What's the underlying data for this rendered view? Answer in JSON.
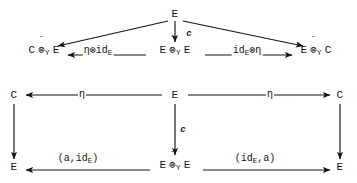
{
  "diagram": {
    "kind": "commutative-diagram",
    "symbols": {
      "tensor": "⊗",
      "hat": "ˆ",
      "eta": "η"
    },
    "nodes": [
      {
        "id": "top-e",
        "text": "E",
        "x": 175,
        "y": 14
      },
      {
        "id": "left-c-tensor-e",
        "left": "C",
        "sub": "Y",
        "right": "E",
        "hat": true,
        "x": 44,
        "y": 52
      },
      {
        "id": "mid-e-tensor-e",
        "left": "E",
        "sub": "Y",
        "right": "E",
        "hat": true,
        "x": 175,
        "y": 52
      },
      {
        "id": "right-e-tensor-c",
        "left": "E",
        "sub": "Y",
        "right": "C",
        "hat": true,
        "x": 316,
        "y": 52
      },
      {
        "id": "mid-left-c",
        "text": "C",
        "x": 14,
        "y": 95
      },
      {
        "id": "mid-center-e",
        "text": "E",
        "x": 175,
        "y": 95
      },
      {
        "id": "mid-right-c",
        "text": "C",
        "x": 340,
        "y": 95
      },
      {
        "id": "bottom-left-e",
        "text": "E",
        "x": 14,
        "y": 167
      },
      {
        "id": "bottom-mid-tensor",
        "left": "E",
        "sub": "Y",
        "right": "E",
        "hat": true,
        "x": 175,
        "y": 167
      },
      {
        "id": "bottom-right-e",
        "text": "E",
        "x": 340,
        "y": 167
      }
    ],
    "arrow_labels": [
      {
        "id": "label-c-top",
        "text": "c",
        "x": 189,
        "y": 34,
        "style": "italic"
      },
      {
        "id": "label-eta-tensor-id",
        "text": "η⊗id",
        "subscript": "E",
        "x": 98,
        "y": 52,
        "style": "plain"
      },
      {
        "id": "label-id-tensor-eta",
        "text": "id",
        "subscript": "E",
        "suffix": "⊗η",
        "x": 247,
        "y": 52,
        "style": "plain"
      },
      {
        "id": "label-eta-left",
        "text": "η",
        "x": 82,
        "y": 95,
        "style": "plain"
      },
      {
        "id": "label-eta-right",
        "text": "η",
        "x": 270,
        "y": 95,
        "style": "plain"
      },
      {
        "id": "label-c-mid",
        "text": "c",
        "x": 183,
        "y": 130,
        "style": "italic"
      },
      {
        "id": "label-a-id",
        "text": "(a,id",
        "subscript": "E",
        "suffix": ")",
        "x": 78,
        "y": 160,
        "style": "plain"
      },
      {
        "id": "label-id-a",
        "text": "(id",
        "subscript": "E",
        "suffix": ",a)",
        "x": 255,
        "y": 160,
        "style": "plain"
      }
    ],
    "arrows": [
      {
        "id": "arrow-top-e-to-left",
        "from": "top-e",
        "to": "left-c-tensor-e",
        "type": "diagonal"
      },
      {
        "id": "arrow-top-e-to-right",
        "from": "top-e",
        "to": "right-e-tensor-c",
        "type": "diagonal"
      },
      {
        "id": "arrow-top-e-to-mid",
        "from": "top-e",
        "to": "mid-e-tensor-e",
        "type": "vertical",
        "label": "c"
      },
      {
        "id": "arrow-mid-to-left",
        "from": "mid-e-tensor-e",
        "to": "left-c-tensor-e",
        "type": "horizontal",
        "label": "η⊗id_E"
      },
      {
        "id": "arrow-mid-to-right",
        "from": "mid-e-tensor-e",
        "to": "right-e-tensor-c",
        "type": "horizontal",
        "label": "id_E⊗η"
      },
      {
        "id": "arrow-e-to-c-left",
        "from": "mid-center-e",
        "to": "mid-left-c",
        "type": "horizontal",
        "label": "η"
      },
      {
        "id": "arrow-e-to-c-right",
        "from": "mid-center-e",
        "to": "mid-right-c",
        "type": "horizontal",
        "label": "η"
      },
      {
        "id": "arrow-c-down-left",
        "from": "mid-left-c",
        "to": "bottom-left-e",
        "type": "vertical"
      },
      {
        "id": "arrow-c-down-right",
        "from": "mid-right-c",
        "to": "bottom-right-e",
        "type": "vertical"
      },
      {
        "id": "arrow-e-down-mid",
        "from": "mid-center-e",
        "to": "bottom-mid-tensor",
        "type": "vertical",
        "label": "c"
      },
      {
        "id": "arrow-bottom-to-left",
        "from": "bottom-mid-tensor",
        "to": "bottom-left-e",
        "type": "horizontal",
        "label": "(a,id_E)"
      },
      {
        "id": "arrow-bottom-to-right",
        "from": "bottom-mid-tensor",
        "to": "bottom-right-e",
        "type": "horizontal",
        "label": "(id_E,a)"
      }
    ]
  },
  "colors": {
    "ink": "#141414",
    "background": "#ffffff"
  }
}
